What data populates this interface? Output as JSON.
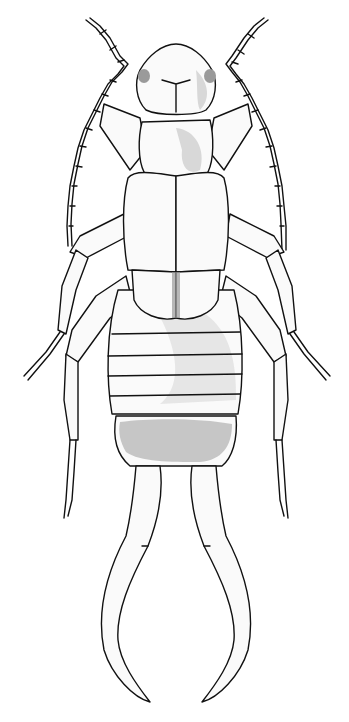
{
  "figure": {
    "style": "black ink stipple line drawing on white",
    "colors": {
      "background": "#ffffff",
      "ink": "#111111"
    },
    "parts": [
      "antennae",
      "head",
      "pronotum",
      "tegmina",
      "abdomen",
      "legs",
      "cerci"
    ],
    "abdomen_segments": 5
  }
}
